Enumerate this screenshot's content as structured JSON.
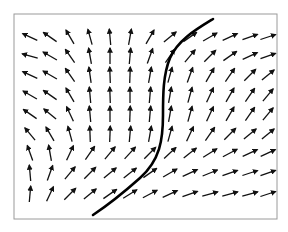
{
  "figure": {
    "type": "vector-field-with-trajectory",
    "frame": {
      "x": 14,
      "y": 14,
      "width": 263,
      "height": 205,
      "stroke": "#9a9a9a"
    },
    "arrow_color": "#111111",
    "curve_color": "#000000",
    "arrow_length": 16,
    "columns_x": [
      30,
      50,
      70,
      90,
      110,
      130,
      150,
      170,
      190,
      210,
      230,
      250,
      268
    ],
    "rows_y": [
      37,
      56,
      75,
      95,
      114,
      134,
      153,
      173,
      194
    ],
    "angles_deg": [
      [
        155,
        145,
        120,
        105,
        95,
        80,
        60,
        40,
        35,
        30,
        25,
        20,
        18
      ],
      [
        165,
        150,
        125,
        100,
        90,
        85,
        70,
        55,
        50,
        45,
        35,
        25,
        20
      ],
      [
        155,
        150,
        125,
        98,
        92,
        88,
        80,
        75,
        70,
        60,
        55,
        45,
        40
      ],
      [
        150,
        145,
        120,
        95,
        92,
        90,
        85,
        80,
        75,
        65,
        60,
        55,
        50
      ],
      [
        145,
        140,
        115,
        95,
        90,
        88,
        85,
        80,
        75,
        65,
        60,
        55,
        50
      ],
      [
        130,
        120,
        105,
        92,
        88,
        85,
        80,
        75,
        65,
        55,
        45,
        40,
        40
      ],
      [
        110,
        100,
        65,
        55,
        50,
        48,
        45,
        42,
        38,
        32,
        28,
        25,
        25
      ],
      [
        95,
        70,
        50,
        45,
        40,
        38,
        35,
        30,
        25,
        22,
        20,
        18,
        20
      ],
      [
        85,
        65,
        45,
        40,
        35,
        32,
        28,
        25,
        20,
        15,
        15,
        15,
        18
      ]
    ],
    "curve_path": "M213,19 C195,30 178,40 170,58 C163,75 163,95 163,115 C163,140 160,160 140,178 C122,194 108,205 93,215"
  }
}
